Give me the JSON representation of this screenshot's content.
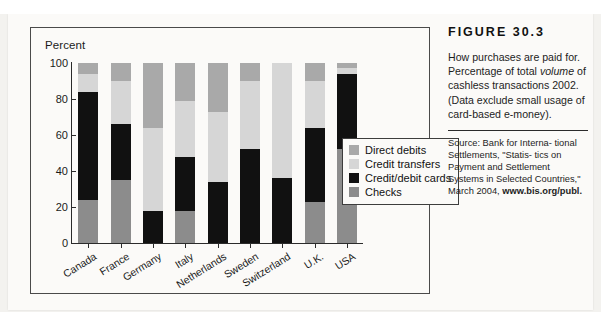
{
  "figure": {
    "number_label": "FIGURE 30.3",
    "caption_line1": "How purchases are paid",
    "caption_line2": "for. Percentage of total",
    "caption_italic": "volume",
    "caption_line3_rest": " of cashless",
    "caption_line4": "transactions 2002. (Data",
    "caption_line5": "exclude small usage of",
    "caption_line6": "card-based e-money).",
    "source_line1": "Source: Bank for Interna-",
    "source_line2": "tional Settlements, \"Statis-",
    "source_line3": "tics on Payment and",
    "source_line4": "Settlement Systems in",
    "source_line5": "Selected Countries,\" March",
    "source_line6_prefix": "2004, ",
    "source_line6_bold": "www.bis.org/publ."
  },
  "chart_data": {
    "type": "bar",
    "stacked": true,
    "title": "",
    "ylabel": "Percent",
    "xlabel": "",
    "ylim": [
      0,
      100
    ],
    "yticks": [
      0,
      20,
      40,
      60,
      80,
      100
    ],
    "grid": false,
    "legend_position": "inside-right",
    "categories": [
      "Canada",
      "France",
      "Germany",
      "Italy",
      "Netherlands",
      "Sweden",
      "Switzerland",
      "U.K.",
      "USA"
    ],
    "series": [
      {
        "name": "Checks",
        "color": "#8c8c8c",
        "values": [
          24,
          35,
          0,
          18,
          0,
          0,
          0,
          23,
          52
        ]
      },
      {
        "name": "Credit/debit cards",
        "color": "#111111",
        "values": [
          60,
          31,
          18,
          30,
          34,
          52,
          36,
          41,
          42
        ]
      },
      {
        "name": "Credit transfers",
        "color": "#d6d6d6",
        "values": [
          10,
          24,
          46,
          31,
          39,
          38,
          64,
          26,
          3
        ]
      },
      {
        "name": "Direct debits",
        "color": "#a9a9a9",
        "values": [
          6,
          10,
          36,
          21,
          27,
          10,
          0,
          10,
          3
        ]
      }
    ],
    "legend": [
      {
        "label": "Direct debits",
        "color": "#a9a9a9"
      },
      {
        "label": "Credit transfers",
        "color": "#d6d6d6"
      },
      {
        "label": "Credit/debit cards",
        "color": "#111111"
      },
      {
        "label": "Checks",
        "color": "#8c8c8c"
      }
    ]
  }
}
